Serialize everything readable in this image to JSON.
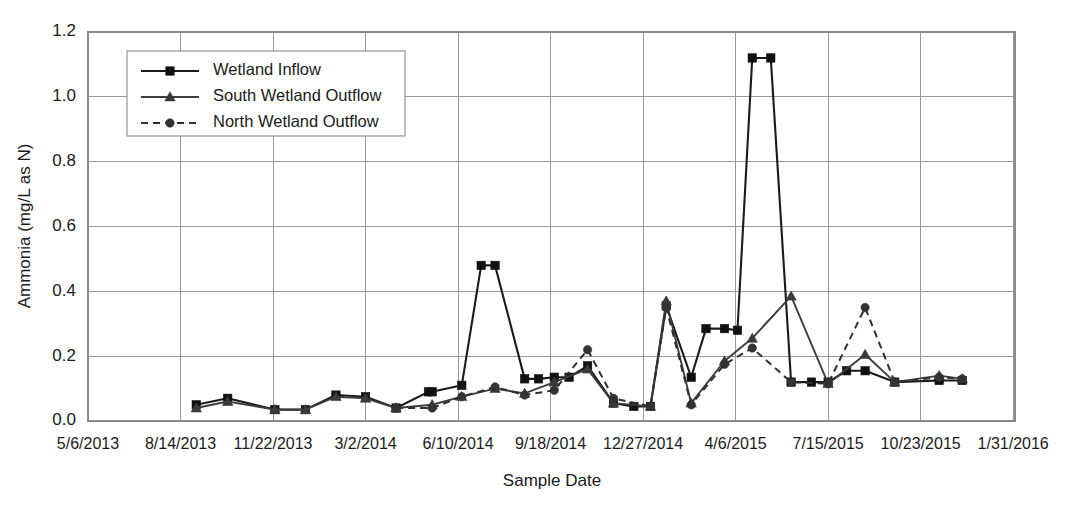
{
  "chart_data": {
    "type": "line",
    "title": "",
    "xlabel": "Sample Date",
    "ylabel": "Ammonia (mg/L as N)",
    "ylim": [
      0.0,
      1.2
    ],
    "yticks": [
      "0.0",
      "0.2",
      "0.4",
      "0.6",
      "0.8",
      "1.0",
      "1.2"
    ],
    "ytick_values": [
      0.0,
      0.2,
      0.4,
      0.6,
      0.8,
      1.0,
      1.2
    ],
    "xticks": [
      "5/6/2013",
      "8/14/2013",
      "11/22/2013",
      "3/2/2014",
      "6/10/2014",
      "9/18/2014",
      "12/27/2014",
      "4/6/2015",
      "7/15/2015",
      "10/23/2015",
      "1/31/2016"
    ],
    "xtick_values": [
      0,
      100,
      200,
      300,
      400,
      500,
      600,
      700,
      800,
      900,
      1000
    ],
    "xlim": [
      0,
      1002
    ],
    "grid": true,
    "legend_position": "top-left",
    "series": [
      {
        "name": "Wetland Inflow",
        "marker": "square",
        "linestyle": "solid",
        "color": "#111111",
        "x": [
          117,
          151,
          202,
          235,
          268,
          300,
          333,
          368,
          372,
          404,
          425,
          440,
          472,
          487,
          504,
          520,
          540,
          568,
          590,
          608,
          625,
          652,
          668,
          688,
          702,
          718,
          738,
          760,
          782,
          800,
          820,
          840,
          872,
          920,
          945
        ],
        "y": [
          0.05,
          0.07,
          0.035,
          0.035,
          0.08,
          0.075,
          0.04,
          0.09,
          0.09,
          0.11,
          0.48,
          0.48,
          0.13,
          0.13,
          0.135,
          0.135,
          0.17,
          0.055,
          0.045,
          0.045,
          0.355,
          0.135,
          0.285,
          0.285,
          0.28,
          1.12,
          1.12,
          0.12,
          0.12,
          0.12,
          0.155,
          0.155,
          0.12,
          0.125,
          0.125
        ]
      },
      {
        "name": "South Wetland Outflow",
        "marker": "triangle",
        "linestyle": "solid",
        "color": "#3a3a3a",
        "x": [
          117,
          151,
          202,
          235,
          268,
          300,
          333,
          372,
          404,
          440,
          472,
          504,
          540,
          568,
          608,
          625,
          652,
          688,
          718,
          760,
          800,
          840,
          872,
          920,
          945
        ],
        "y": [
          0.04,
          0.06,
          0.035,
          0.035,
          0.075,
          0.07,
          0.04,
          0.05,
          0.075,
          0.1,
          0.085,
          0.12,
          0.16,
          0.055,
          0.045,
          0.37,
          0.055,
          0.185,
          0.255,
          0.385,
          0.115,
          0.205,
          0.12,
          0.14,
          0.13
        ]
      },
      {
        "name": "North Wetland Outflow",
        "marker": "circle",
        "linestyle": "dashed",
        "color": "#333333",
        "x": [
          333,
          372,
          404,
          440,
          472,
          504,
          540,
          568,
          608,
          625,
          652,
          688,
          718,
          760,
          800,
          840,
          872,
          920,
          945
        ],
        "y": [
          0.04,
          0.04,
          0.075,
          0.105,
          0.08,
          0.095,
          0.22,
          0.07,
          0.045,
          0.35,
          0.05,
          0.175,
          0.225,
          0.12,
          0.115,
          0.35,
          0.12,
          0.135,
          0.13
        ]
      }
    ]
  },
  "legend": {
    "entries": [
      {
        "label": "Wetland Inflow"
      },
      {
        "label": "South Wetland Outflow"
      },
      {
        "label": "North Wetland Outflow"
      }
    ]
  },
  "colors": {
    "grid": "#9a9a9a",
    "frame": "#8a8a8a",
    "text": "#1a1a1a",
    "inflow": "#111111",
    "south": "#3a3a3a",
    "north": "#333333"
  }
}
